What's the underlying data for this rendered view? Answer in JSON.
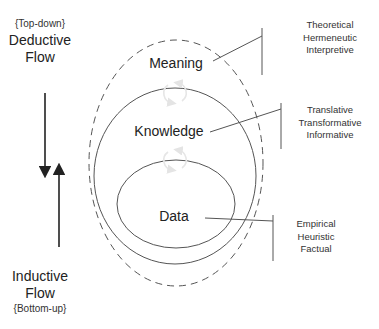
{
  "deductive": {
    "qualifier": "{Top-down}",
    "title_line1": "Deductive",
    "title_line2": "Flow"
  },
  "inductive": {
    "title_line1": "Inductive",
    "title_line2": "Flow",
    "qualifier": "{Bottom-up}"
  },
  "tiers": [
    {
      "label": "Meaning",
      "descriptors": [
        "Theoretical",
        "Hermeneutic",
        "Interpretive"
      ]
    },
    {
      "label": "Knowledge",
      "descriptors": [
        "Translative",
        "Transformative",
        "Informative"
      ]
    },
    {
      "label": "Data",
      "descriptors": [
        "Empirical",
        "Heuristic",
        "Factual"
      ]
    }
  ],
  "colors": {
    "line": "#555555",
    "arrow": "#222222",
    "cycle_arrow": "#e6e6e6",
    "text": "#222222"
  }
}
